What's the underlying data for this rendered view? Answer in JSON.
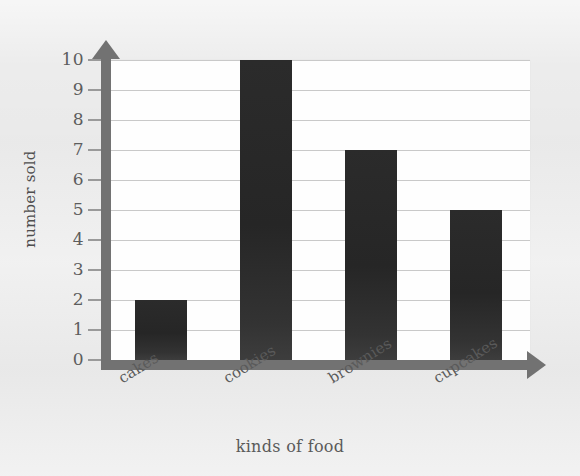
{
  "chart_data": {
    "type": "bar",
    "title": "",
    "categories": [
      "cakes",
      "cookies",
      "brownies",
      "cupcakes"
    ],
    "values": [
      2,
      10,
      7,
      5
    ],
    "xlabel": "kinds of food",
    "ylabel": "number sold",
    "ylim": [
      0,
      10
    ],
    "ytick_labels": [
      "0",
      "1",
      "2",
      "3",
      "4",
      "5",
      "6",
      "7",
      "8",
      "9",
      "10"
    ],
    "ytick_values": [
      0,
      1,
      2,
      3,
      4,
      5,
      6,
      7,
      8,
      9,
      10
    ],
    "grid": true,
    "grid_axis": "y",
    "legend": false,
    "legend_position": "none",
    "bar_color": "#2b2b2b",
    "axis_color": "#727272",
    "gridline_color": "#c9c9c9",
    "plot_background": "#fefefe",
    "figure_background": "#ececec",
    "label_color": "#5a5a5a",
    "x_label_rotation": -32,
    "axis_style": "arrow"
  }
}
